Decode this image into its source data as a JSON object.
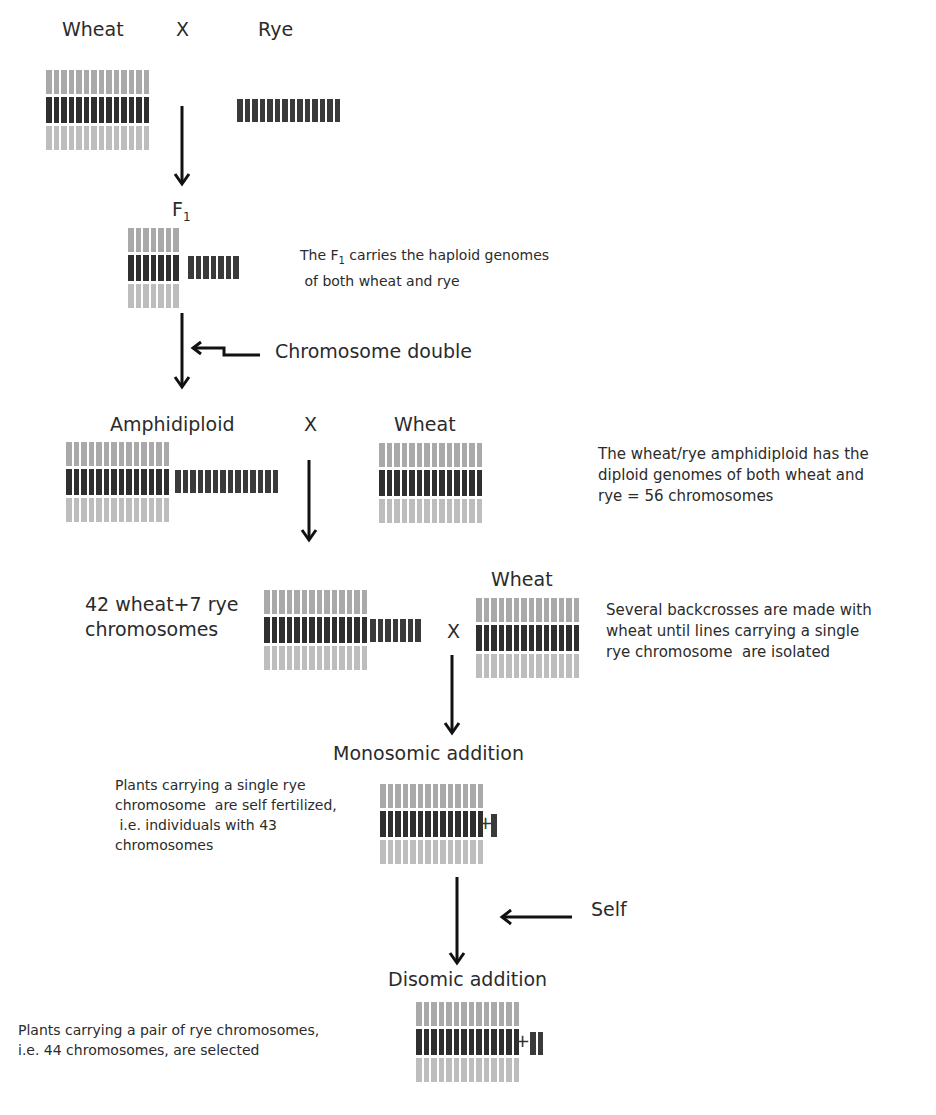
{
  "diagram": {
    "title_residue": "",
    "stages": {
      "parents": {
        "left_label": "Wheat",
        "cross": "X",
        "right_label": "Rye"
      },
      "f1": {
        "label_main": "F",
        "label_sub": "1",
        "note_line1_pre": "The F",
        "note_line1_sub": "1",
        "note_line1_post": " carries the haploid genomes",
        "note_line2": " of both wheat and rye"
      },
      "doubling": {
        "label": "Chromosome double"
      },
      "amphidiploid": {
        "label": "Amphidiploid",
        "cross": "X",
        "partner_label": "Wheat",
        "note": "The wheat/rye amphidiploid has the\ndiploid genomes of both wheat and\nrye = 56 chromosomes"
      },
      "backcross": {
        "label": "42 wheat+7 rye\nchromosomes",
        "cross": "X",
        "partner_label": "Wheat",
        "note": "Several backcrosses are made with\nwheat until lines carrying a single\nrye chromosome  are isolated"
      },
      "monosomic": {
        "label": "Monosomic addition",
        "plus": "+",
        "note": "Plants carrying a single rye\nchromosome  are self fertilized,\n i.e. individuals with 43\nchromosomes"
      },
      "self": {
        "label": "Self"
      },
      "disomic": {
        "label": "Disomic addition",
        "plus": "+",
        "note": "Plants carrying a pair of rye chromosomes,\ni.e. 44 chromosomes, are selected"
      }
    },
    "colors": {
      "wheat_top": "#a9a9a9",
      "wheat_mid": "#2f2f2f",
      "wheat_bottom": "#bdbdbd",
      "rye": "#3a3a3a",
      "arrow": "#111111"
    },
    "chromosome_counts": {
      "wheat_per_row": 14,
      "rye_parent": 14,
      "f1_wheat_per_row": 7,
      "f1_rye": 7,
      "amphidiploid_rye": 14,
      "backcross_rye": 7,
      "monosomic_extra": 1,
      "disomic_extra": 2
    }
  }
}
